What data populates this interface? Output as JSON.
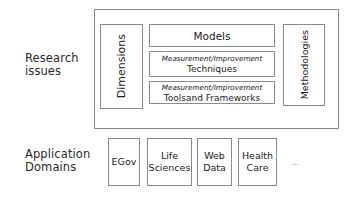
{
  "diagram": {
    "research_issues": {
      "label_lines": [
        "Research",
        "issues"
      ],
      "dimensions": "Dimensions",
      "models": "Models",
      "techniques": {
        "line1": "Measurement/Improvement",
        "line2": "Techniques"
      },
      "tools": {
        "line1": "Measurement/Improvement",
        "line2": "Toolsand Frameworks"
      },
      "methodologies": "Methodologies"
    },
    "application_domains": {
      "label_lines": [
        "Application",
        "Domains"
      ],
      "items": [
        {
          "lines": [
            "EGov"
          ]
        },
        {
          "lines": [
            "Life",
            "Sciences"
          ]
        },
        {
          "lines": [
            "Web",
            "Data"
          ]
        },
        {
          "lines": [
            "Health",
            "Care"
          ]
        }
      ],
      "more": "..."
    },
    "colors": {
      "border": "#8a8a8a",
      "text": "#222222",
      "background": "#ffffff"
    }
  }
}
